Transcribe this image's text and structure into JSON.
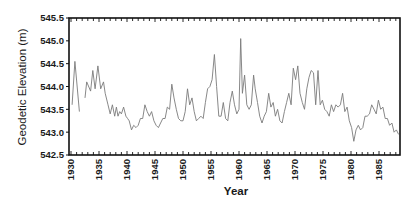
{
  "chart_data": {
    "type": "line",
    "title": "",
    "xlabel": "Year",
    "ylabel": "Geodetic Elevation (m)",
    "xlim": [
      1929.8,
      1988.6
    ],
    "ylim": [
      542.5,
      545.5
    ],
    "grid": false,
    "legend": null,
    "x_ticks": [
      "1930",
      "1935",
      "1940",
      "1945",
      "1950",
      "1955",
      "1960",
      "1965",
      "1970",
      "1975",
      "1980",
      "1985"
    ],
    "y_ticks": [
      "542.5",
      "543.0",
      "543.5",
      "544.0",
      "544.5",
      "545.0",
      "545.5"
    ],
    "series": [
      {
        "name": "Geodetic elevation",
        "color": "#7a7a7a",
        "segments": [
          {
            "x": [
              1930.2,
              1930.7,
              1931.5
            ],
            "y": [
              543.6,
              544.55,
              543.45
            ]
          },
          {
            "x": [
              1932.5,
              1932.8,
              1933.5,
              1933.9,
              1934.3,
              1934.8,
              1935.3,
              1935.8,
              1936.1,
              1936.6,
              1937.0,
              1937.4,
              1937.8,
              1938.1,
              1938.4,
              1938.7,
              1939.0,
              1939.4,
              1939.8,
              1940.1,
              1940.4,
              1940.8,
              1941.2,
              1941.6,
              1942.0,
              1942.4,
              1942.8,
              1943.2,
              1943.6,
              1944.0,
              1944.4,
              1944.8,
              1945.2,
              1945.6,
              1946.0,
              1946.4,
              1946.8,
              1947.2,
              1947.6,
              1948.0,
              1948.4,
              1948.8,
              1949.2,
              1949.6,
              1950.0,
              1950.4,
              1950.8,
              1951.2,
              1951.6,
              1952.0,
              1952.4,
              1952.8,
              1953.2,
              1953.6,
              1954.0,
              1954.4,
              1954.8,
              1955.2,
              1955.6,
              1956.0,
              1956.4,
              1956.8,
              1957.2,
              1957.6,
              1958.0,
              1958.4,
              1958.8,
              1959.2,
              1959.6,
              1960.0,
              1960.3,
              1960.6,
              1961.0,
              1961.4,
              1961.8,
              1962.2,
              1962.6,
              1962.9,
              1963.3,
              1963.7,
              1964.1,
              1964.5,
              1964.9,
              1965.3,
              1965.7,
              1966.1,
              1966.5,
              1966.9,
              1967.3,
              1967.7,
              1968.1,
              1968.5,
              1968.9,
              1969.3,
              1969.7,
              1970.1,
              1970.5,
              1970.9,
              1971.3,
              1971.7,
              1972.1,
              1972.5,
              1972.9,
              1973.3,
              1973.7,
              1974.1,
              1974.5,
              1974.9,
              1975.3,
              1975.7,
              1976.1,
              1976.5,
              1976.9,
              1977.3,
              1977.7,
              1978.1,
              1978.5,
              1978.9,
              1979.3,
              1979.7,
              1980.1,
              1980.5,
              1980.9,
              1981.3,
              1981.7,
              1982.1,
              1982.5,
              1982.9,
              1983.3,
              1983.7,
              1984.1,
              1984.5,
              1984.9,
              1985.3,
              1985.7,
              1986.1,
              1986.5,
              1986.9,
              1987.3,
              1987.7,
              1988.1,
              1988.5
            ],
            "y": [
              543.75,
              544.1,
              543.9,
              544.35,
              543.95,
              544.45,
              543.95,
              544.1,
              543.85,
              543.6,
              543.4,
              543.6,
              543.35,
              543.55,
              543.35,
              543.45,
              543.4,
              543.55,
              543.35,
              543.3,
              543.25,
              543.05,
              543.15,
              543.1,
              543.15,
              543.3,
              543.3,
              543.6,
              543.45,
              543.35,
              543.45,
              543.25,
              543.15,
              543.1,
              543.2,
              543.3,
              543.3,
              543.55,
              543.5,
              544.05,
              543.75,
              543.5,
              543.3,
              543.25,
              543.25,
              543.45,
              543.95,
              543.6,
              543.75,
              543.45,
              543.25,
              543.3,
              543.35,
              543.3,
              543.65,
              543.95,
              544.0,
              544.15,
              544.7,
              544.0,
              543.35,
              543.35,
              543.65,
              543.3,
              543.25,
              543.65,
              543.9,
              543.6,
              543.4,
              543.5,
              545.05,
              543.85,
              544.25,
              543.6,
              543.5,
              543.6,
              544.25,
              543.95,
              543.65,
              543.35,
              543.2,
              543.35,
              543.45,
              543.85,
              543.55,
              543.65,
              543.35,
              543.5,
              543.25,
              543.2,
              543.45,
              543.65,
              543.85,
              543.6,
              544.4,
              544.15,
              544.45,
              543.85,
              543.65,
              543.5,
              543.95,
              544.2,
              544.35,
              544.3,
              543.6,
              544.35,
              543.6,
              543.7,
              543.5,
              543.45,
              543.35,
              543.6,
              543.45,
              543.6,
              543.55,
              543.6,
              543.85,
              543.45,
              543.55,
              543.25,
              543.1,
              542.8,
              543.05,
              543.15,
              543.05,
              543.1,
              543.35,
              543.35,
              543.4,
              543.6,
              543.5,
              543.4,
              543.7,
              543.5,
              543.55,
              543.3,
              543.3,
              543.15,
              543.2,
              543.0,
              543.05,
              542.95
            ],
            "note": "values estimated from pixel positions"
          }
        ]
      }
    ]
  }
}
